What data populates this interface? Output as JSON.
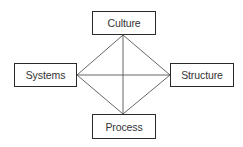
{
  "diagram": {
    "type": "tetrahedral-relationship",
    "nodes": {
      "top": {
        "label": "Culture"
      },
      "left": {
        "label": "Systems"
      },
      "right": {
        "label": "Structure"
      },
      "bottom": {
        "label": "Process"
      }
    },
    "edges": [
      {
        "from": "Culture",
        "to": "Systems"
      },
      {
        "from": "Culture",
        "to": "Structure"
      },
      {
        "from": "Culture",
        "to": "Process"
      },
      {
        "from": "Systems",
        "to": "Structure"
      },
      {
        "from": "Systems",
        "to": "Process"
      },
      {
        "from": "Structure",
        "to": "Process"
      }
    ],
    "colors": {
      "line": "#555555",
      "border": "#2a2a2a",
      "text": "#333333",
      "background": "#ffffff"
    }
  }
}
